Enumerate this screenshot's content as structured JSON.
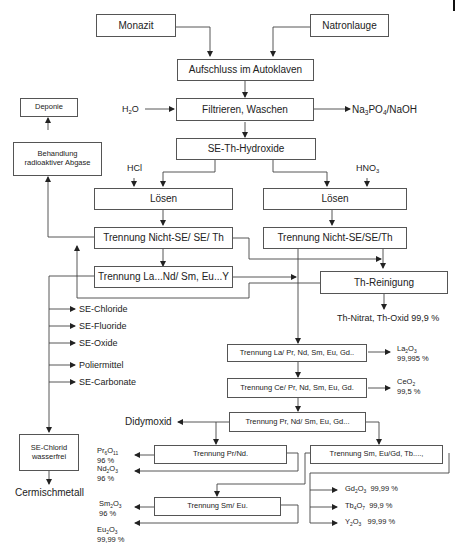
{
  "diagram": {
    "language": "de",
    "boxes": {
      "monazit": "Monazit",
      "natronlauge": "Natronlauge",
      "aufschluss": "Aufschluss im Autoklaven",
      "filtrieren": "Filtrieren, Waschen",
      "hydroxide": "SE-Th-Hydroxide",
      "loesen_left": "Lösen",
      "loesen_right": "Lösen",
      "trennung_nicht_se_left": "Trennung Nicht-SE/ SE/ Th",
      "trennung_nicht_se_right": "Trennung Nicht-SE/SE/Th",
      "trennung_la_nd": "Trennung La...Nd/ Sm, Eu...Y",
      "th_reinigung": "Th-Reinigung",
      "deponie": "Deponie",
      "behandlung_line1": "Behandlung",
      "behandlung_line2": "radioaktiver Abgase",
      "se_chlorid_line1": "SE-Chlorid",
      "se_chlorid_line2": "wasserfrei",
      "trennung_la_pr": "Trennung La/ Pr, Nd, Sm, Eu, Gd..",
      "trennung_ce_pr": "Trennung Ce/ Pr, Nd, Sm, Eu, Gd.",
      "trennung_pr_nd_sm": "Trennung Pr, Nd/ Sm, Eu, Gd...",
      "trennung_pr_nd": "Trennung Pr/Nd.",
      "trennung_sm_eu_gd": "Trennung  Sm, Eu/Gd, Tb....,",
      "trennung_sm_eu": "Trennung Sm/ Eu."
    },
    "inputs": {
      "h2o": {
        "base": "H",
        "sub": "2",
        "tail": "O"
      },
      "hcl": "HCl",
      "hno3": {
        "base": "HNO",
        "sub": "3"
      }
    },
    "outputs": {
      "na3po4": {
        "p1": "Na",
        "s1": "3",
        "p2": "PO",
        "s2": "4",
        "p3": "/NaOH"
      },
      "th_nitrat": "Th-Nitrat, Th-Oxid 99,9 %",
      "se_products": [
        "SE-Chloride",
        "SE-Fluoride",
        "SE-Oxide",
        "Poliermittel",
        "SE-Carbonate"
      ],
      "cermischmetall": "Cermischmetall",
      "didymoxid": "Didymoxid",
      "la2o3": {
        "p1": "La",
        "s1": "2",
        "p2": "O",
        "s2": "3",
        "purity": "99,995 %"
      },
      "ceo2": {
        "p1": "CeO",
        "s1": "2",
        "purity": "99,5 %"
      },
      "pr6o11": {
        "p1": "Pr",
        "s1": "6",
        "p2": "O",
        "s2": "11",
        "purity": "96 %"
      },
      "nd2o3": {
        "p1": "Nd",
        "s1": "2",
        "p2": "O",
        "s2": "3",
        "purity": "96 %"
      },
      "sm2o3": {
        "p1": "Sm",
        "s1": "2",
        "p2": "O",
        "s2": "3",
        "purity": "96 %"
      },
      "eu2o3": {
        "p1": "Eu",
        "s1": "2",
        "p2": "O",
        "s2": "3",
        "purity": "99,99 %"
      },
      "gd2o3": {
        "p1": "Gd",
        "s1": "2",
        "p2": "O",
        "s2": "3",
        "purity": "99,99 %"
      },
      "tb4o7": {
        "p1": "Tb",
        "s1": "4",
        "p2": "O",
        "s2": "7",
        "purity": "99,9 %"
      },
      "y2o3": {
        "p1": "Y",
        "s1": "2",
        "p2": "O",
        "s2": "3",
        "purity": "99,99  %"
      }
    },
    "colors": {
      "line": "#444444",
      "box_border": "#555555",
      "text": "#222222"
    }
  }
}
